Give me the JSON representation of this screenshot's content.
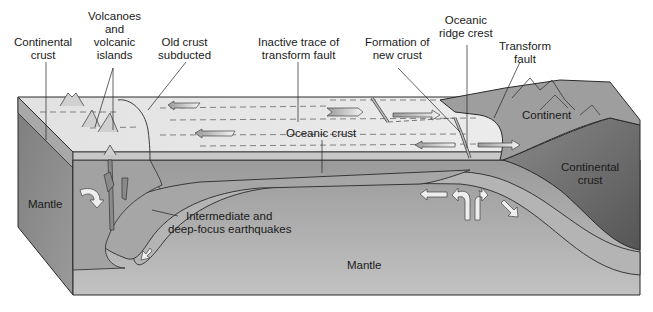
{
  "colors": {
    "background": "#ffffff",
    "top_surface": "#e4e4e4",
    "oceanic_crust": "#b9b9b9",
    "mantle": "#9c9c9c",
    "mantle_light": "#b4b4b4",
    "left_face": "#8a8a8a",
    "continental_crust": "#6e6e6e",
    "continent_surface": "#9a9a9a",
    "outline": "#2a2a2a",
    "arrow_fill": "#eeeeee",
    "label_text": "#1a1a1a"
  },
  "labels": {
    "continental_crust_left": [
      "Continental",
      "crust"
    ],
    "volcanoes": [
      "Volcanoes",
      "and",
      "volcanic",
      "islands"
    ],
    "old_crust": [
      "Old crust",
      "subducted"
    ],
    "inactive_trace": [
      "Inactive trace of",
      "transform fault"
    ],
    "formation": [
      "Formation of",
      "new crust"
    ],
    "ridge_crest": [
      "Oceanic",
      "ridge crest"
    ],
    "transform_fault": [
      "Transform",
      "fault"
    ],
    "continent": "Continent",
    "oceanic_crust": "Oceanic crust",
    "continental_crust_right": [
      "Continental",
      "crust"
    ],
    "mantle_left": "Mantle",
    "earthquakes": [
      "Intermediate and",
      "deep-focus earthquakes"
    ],
    "mantle_bottom": "Mantle"
  }
}
